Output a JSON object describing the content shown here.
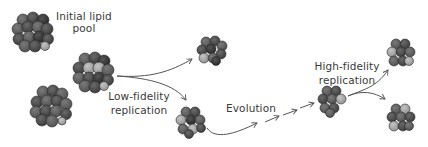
{
  "diagram": {
    "type": "process-flow",
    "background": "#ffffff",
    "colors": {
      "text": "#3a3a3a",
      "arrow": "#555555",
      "lipid_dark": "#3c3c3c",
      "lipid_mid": "#5e5e5e",
      "lipid_light": "#a8a8a8",
      "lipid_outline": "#2a2a2a"
    },
    "labels": {
      "initial_pool_line1": "Initial lipid",
      "initial_pool_line2": "pool",
      "low_fidelity_line1": "Low-fidelity",
      "low_fidelity_line2": "replication",
      "evolution": "Evolution",
      "high_fidelity_line1": "High-fidelity",
      "high_fidelity_line2": "replication"
    },
    "nodes": [
      {
        "id": "pool-assembly-1",
        "role": "initial lipid assembly",
        "size": "large"
      },
      {
        "id": "pool-assembly-2",
        "role": "initial lipid assembly (replicating)",
        "size": "large"
      },
      {
        "id": "pool-assembly-3",
        "role": "initial lipid assembly",
        "size": "large"
      },
      {
        "id": "low-fidelity-product-1",
        "role": "low-fidelity offspring",
        "size": "medium"
      },
      {
        "id": "low-fidelity-product-2",
        "role": "low-fidelity offspring (evolves)",
        "size": "medium"
      },
      {
        "id": "evolved-assembly",
        "role": "evolved assembly",
        "size": "medium"
      },
      {
        "id": "high-fidelity-product-1",
        "role": "high-fidelity offspring",
        "size": "medium"
      },
      {
        "id": "high-fidelity-product-2",
        "role": "high-fidelity offspring",
        "size": "medium"
      }
    ],
    "edges": [
      {
        "from": "pool-assembly-2",
        "to": "low-fidelity-product-1",
        "label": "Low-fidelity replication"
      },
      {
        "from": "pool-assembly-2",
        "to": "low-fidelity-product-2",
        "label": "Low-fidelity replication"
      },
      {
        "from": "low-fidelity-product-2",
        "to": "evolved-assembly",
        "label": "Evolution"
      },
      {
        "from": "evolved-assembly",
        "to": "high-fidelity-product-1",
        "label": "High-fidelity replication"
      },
      {
        "from": "evolved-assembly",
        "to": "high-fidelity-product-2",
        "label": "High-fidelity replication"
      }
    ]
  }
}
